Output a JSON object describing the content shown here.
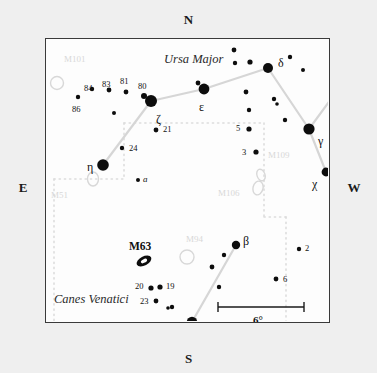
{
  "compass": {
    "north": "N",
    "south": "S",
    "east": "E",
    "west": "W"
  },
  "constellations": [
    {
      "name": "Ursa Major",
      "x": 118,
      "y": 14
    },
    {
      "name": "Canes Venatici",
      "x": 8,
      "y": 254
    }
  ],
  "scale_bar": {
    "label": "6°",
    "x1": 172,
    "x2": 258,
    "y": 268
  },
  "messier_bright": [
    {
      "label": "M63",
      "x": 83,
      "y": 202,
      "ellipse_x": 98,
      "ellipse_y": 222,
      "rx": 8,
      "ry": 4.5,
      "rot": -28
    }
  ],
  "messier_faint": [
    {
      "label": "M101",
      "x": 18,
      "y": 16,
      "marker": "circle",
      "mx": 11,
      "my": 44,
      "r": 6.5
    },
    {
      "label": "M51",
      "x": 5,
      "y": 152,
      "marker": "ellipse",
      "mx": 47,
      "my": 140,
      "rx": 5.5,
      "ry": 7,
      "rot": 0
    },
    {
      "label": "M109",
      "x": 222,
      "y": 112,
      "marker": "ellipse",
      "mx": 215,
      "my": 136,
      "rx": 4,
      "ry": 6,
      "rot": -20
    },
    {
      "label": "M106",
      "x": 172,
      "y": 150,
      "marker": "ellipse",
      "mx": 212,
      "my": 149,
      "rx": 5,
      "ry": 7,
      "rot": 15
    },
    {
      "label": "M94",
      "x": 140,
      "y": 196,
      "marker": "circle",
      "mx": 141,
      "my": 218,
      "r": 7
    }
  ],
  "stars": [
    {
      "name": "zeta",
      "x": 105,
      "y": 62,
      "r": 6.0
    },
    {
      "name": "epsilon",
      "x": 158,
      "y": 50,
      "r": 5.4
    },
    {
      "name": "delta",
      "x": 222,
      "y": 29,
      "r": 5.0
    },
    {
      "name": "gamma",
      "x": 263,
      "y": 90,
      "r": 5.6
    },
    {
      "name": "eta",
      "x": 57,
      "y": 126,
      "r": 5.8
    },
    {
      "name": "chi",
      "x": 280,
      "y": 133,
      "r": 4.4
    },
    {
      "name": "alpha",
      "x": 146,
      "y": 283,
      "r": 5.2
    },
    {
      "name": "beta",
      "x": 190,
      "y": 206,
      "r": 4.2
    },
    {
      "name": "s-80",
      "x": 98,
      "y": 57,
      "r": 3.0
    },
    {
      "name": "s-81",
      "x": 80,
      "y": 53,
      "r": 2.4
    },
    {
      "name": "s-83",
      "x": 63,
      "y": 51,
      "r": 2.4
    },
    {
      "name": "s-84",
      "x": 46,
      "y": 50,
      "r": 2.2
    },
    {
      "name": "s-86",
      "x": 32,
      "y": 58,
      "r": 2.2
    },
    {
      "name": "s-faint1",
      "x": 68,
      "y": 74,
      "r": 2.0
    },
    {
      "name": "s-21",
      "x": 110,
      "y": 91,
      "r": 2.4
    },
    {
      "name": "s-24",
      "x": 76,
      "y": 109,
      "r": 2.2
    },
    {
      "name": "s-a",
      "x": 92,
      "y": 141,
      "r": 2.0
    },
    {
      "name": "s-5",
      "x": 203,
      "y": 90,
      "r": 2.6
    },
    {
      "name": "s-3",
      "x": 210,
      "y": 113,
      "r": 2.6
    },
    {
      "name": "s-2",
      "x": 253,
      "y": 210,
      "r": 2.2
    },
    {
      "name": "s-6",
      "x": 230,
      "y": 240,
      "r": 2.4
    },
    {
      "name": "s-19",
      "x": 114,
      "y": 248,
      "r": 2.6
    },
    {
      "name": "s-20",
      "x": 105,
      "y": 249,
      "r": 2.6
    },
    {
      "name": "s-23",
      "x": 110,
      "y": 262,
      "r": 2.4
    },
    {
      "name": "s-um1",
      "x": 188,
      "y": 11,
      "r": 2.4
    },
    {
      "name": "s-um2",
      "x": 189,
      "y": 24,
      "r": 2.2
    },
    {
      "name": "s-um3",
      "x": 204,
      "y": 23,
      "r": 2.6
    },
    {
      "name": "s-um4",
      "x": 152,
      "y": 44,
      "r": 2.4
    },
    {
      "name": "s-um5",
      "x": 200,
      "y": 53,
      "r": 2.4
    },
    {
      "name": "s-um6",
      "x": 244,
      "y": 18,
      "r": 2.2
    },
    {
      "name": "s-um7",
      "x": 257,
      "y": 31,
      "r": 2.0
    },
    {
      "name": "s-um8",
      "x": 228,
      "y": 60,
      "r": 2.2
    },
    {
      "name": "s-um9",
      "x": 231,
      "y": 65,
      "r": 1.8
    },
    {
      "name": "s-um10",
      "x": 203,
      "y": 71,
      "r": 2.2
    },
    {
      "name": "s-um11",
      "x": 239,
      "y": 81,
      "r": 2.2
    },
    {
      "name": "s-cv1",
      "x": 178,
      "y": 216,
      "r": 2.2
    },
    {
      "name": "s-cv2",
      "x": 166,
      "y": 228,
      "r": 2.4
    },
    {
      "name": "s-cv3",
      "x": 173,
      "y": 248,
      "r": 2.2
    },
    {
      "name": "s-cv4",
      "x": 126,
      "y": 268,
      "r": 2.2
    },
    {
      "name": "s-cv5",
      "x": 158,
      "y": 288,
      "r": 2.2
    },
    {
      "name": "s-cv6",
      "x": 124,
      "y": 287,
      "r": 2.0
    },
    {
      "name": "s-cv7",
      "x": 122,
      "y": 269,
      "r": 1.8
    },
    {
      "name": "s-cv8",
      "x": 133,
      "y": 300,
      "r": 2.2
    }
  ],
  "star_labels": [
    {
      "text": "ζ",
      "x": 110,
      "y": 74,
      "cls": "greek"
    },
    {
      "text": "ε",
      "x": 153,
      "y": 62,
      "cls": "greek"
    },
    {
      "text": "δ",
      "x": 232,
      "y": 18,
      "cls": "greek"
    },
    {
      "text": "γ",
      "x": 272,
      "y": 96,
      "cls": "greek"
    },
    {
      "text": "η",
      "x": 41,
      "y": 122,
      "cls": "greek"
    },
    {
      "text": "χ",
      "x": 266,
      "y": 139,
      "cls": "greek"
    },
    {
      "text": "α",
      "x": 131,
      "y": 288,
      "cls": "greek"
    },
    {
      "text": "β",
      "x": 197,
      "y": 196,
      "cls": "greek"
    },
    {
      "text": "80",
      "x": 92,
      "y": 43,
      "cls": "flam"
    },
    {
      "text": "81",
      "x": 74,
      "y": 38,
      "cls": "flam"
    },
    {
      "text": "83",
      "x": 56,
      "y": 41,
      "cls": "flam"
    },
    {
      "text": "84",
      "x": 38,
      "y": 45,
      "cls": "flam"
    },
    {
      "text": "86",
      "x": 26,
      "y": 66,
      "cls": "flam"
    },
    {
      "text": "21",
      "x": 117,
      "y": 86,
      "cls": "flam"
    },
    {
      "text": "24",
      "x": 83,
      "y": 105,
      "cls": "flam"
    },
    {
      "text": "a",
      "x": 97,
      "y": 136,
      "cls": "bayer-it"
    },
    {
      "text": "5",
      "x": 190,
      "y": 85,
      "cls": "flam"
    },
    {
      "text": "3",
      "x": 196,
      "y": 109,
      "cls": "flam"
    },
    {
      "text": "2",
      "x": 259,
      "y": 205,
      "cls": "flam"
    },
    {
      "text": "6",
      "x": 237,
      "y": 236,
      "cls": "flam"
    },
    {
      "text": "19",
      "x": 120,
      "y": 243,
      "cls": "flam"
    },
    {
      "text": "20",
      "x": 89,
      "y": 243,
      "cls": "flam"
    },
    {
      "text": "23",
      "x": 94,
      "y": 258,
      "cls": "flam"
    }
  ],
  "asterism_lines": [
    {
      "from": [
        57,
        126
      ],
      "to": [
        105,
        62
      ]
    },
    {
      "from": [
        105,
        62
      ],
      "to": [
        158,
        50
      ]
    },
    {
      "from": [
        158,
        50
      ],
      "to": [
        222,
        29
      ]
    },
    {
      "from": [
        222,
        29
      ],
      "to": [
        263,
        90
      ]
    },
    {
      "from": [
        263,
        90
      ],
      "to": [
        285,
        60
      ]
    },
    {
      "from": [
        263,
        90
      ],
      "to": [
        280,
        133
      ]
    },
    {
      "from": [
        146,
        283
      ],
      "to": [
        190,
        206
      ]
    }
  ],
  "boundary_segments": [
    {
      "pts": "78,84 218,84"
    },
    {
      "pts": "218,84 218,150"
    },
    {
      "pts": "78,84 78,140"
    },
    {
      "pts": "8,140 78,140"
    },
    {
      "pts": "8,140 8,285"
    },
    {
      "pts": "218,150 218,178"
    },
    {
      "pts": "240,178 240,285"
    },
    {
      "pts": "218,178 240,178"
    }
  ],
  "colors": {
    "frame_border": "#3a3a3a",
    "star_fill": "#0d0d0d",
    "asterism_line": "#d6d6d6",
    "boundary_dots": "#dcdcdc",
    "faint_label": "#d8d8d8",
    "page_bg": "#efefef",
    "sky_bg": "#fdfdfd"
  }
}
